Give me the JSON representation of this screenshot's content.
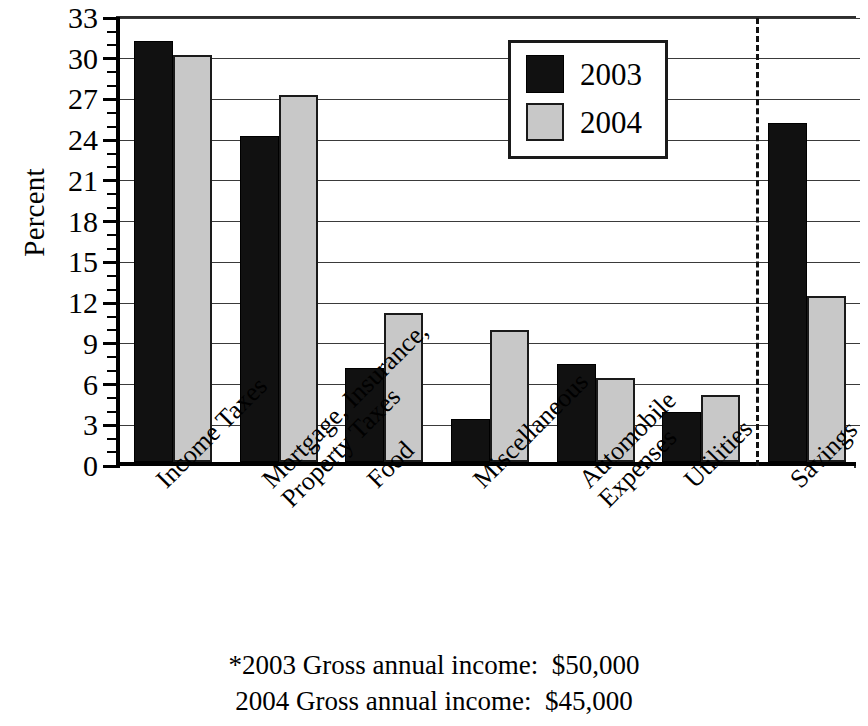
{
  "chart_data": {
    "type": "bar",
    "title": "",
    "xlabel": "",
    "ylabel": "Percent",
    "ylim": [
      0,
      33
    ],
    "ytick_step": 3,
    "yminor_step": 1,
    "grid": true,
    "legend_position": "upper-right-inside",
    "yticks": [
      "0",
      "3",
      "6",
      "9",
      "12",
      "15",
      "18",
      "21",
      "24",
      "27",
      "30",
      "33"
    ],
    "categories": [
      "Income Taxes",
      "Mortgage, Insurance, Property Taxes",
      "Food",
      "Miscellaneous",
      "Automobile Expenses",
      "Utilities",
      "Savings"
    ],
    "category_lines": [
      [
        "Income Taxes"
      ],
      [
        "Mortgage, Insurance,",
        "Property Taxes"
      ],
      [
        "Food"
      ],
      [
        "Miscellaneous"
      ],
      [
        "Automobile",
        "Expenses"
      ],
      [
        "Utilities"
      ],
      [
        "Savings"
      ]
    ],
    "series": [
      {
        "name": "2003",
        "color": "#111111",
        "values": [
          31,
          24,
          6.9,
          3.2,
          7.2,
          3.7,
          25
        ]
      },
      {
        "name": "2004",
        "color": "#c8c8c8",
        "values": [
          30,
          27,
          11,
          9.7,
          6.2,
          4.9,
          12.2
        ]
      }
    ],
    "separator_before_category": "Savings",
    "annotations": [
      "*2003 Gross annual income:  $50,000",
      "2004 Gross annual income:  $45,000"
    ]
  },
  "legend": {
    "items": [
      {
        "label": "2003",
        "swatch": "black"
      },
      {
        "label": "2004",
        "swatch": "gray"
      }
    ]
  },
  "footer": {
    "line1": "*2003 Gross annual income:  $50,000",
    "line2": "2004 Gross annual income:  $45,000"
  },
  "colors": {
    "series_2003": "#111111",
    "series_2004": "#c8c8c8",
    "axis": "#000000",
    "grid": "#3a3a3a",
    "background": "#ffffff"
  }
}
